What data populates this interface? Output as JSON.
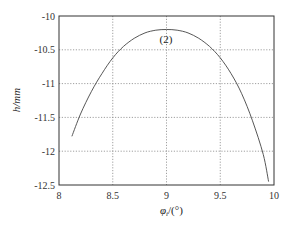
{
  "chart_data": {
    "type": "line",
    "title": "",
    "xlabel": "φ_i/(°)",
    "ylabel": "h/mm",
    "xlim": [
      8,
      10
    ],
    "ylim": [
      -12.5,
      -10
    ],
    "grid": true,
    "x_ticks": [
      "8",
      "8.5",
      "9",
      "9.5",
      "10"
    ],
    "y_ticks": [
      "-10",
      "-10.5",
      "-11",
      "-11.5",
      "-12",
      "-12.5"
    ],
    "annotations": [
      {
        "text": "(2)",
        "x": 9.0,
        "y": -10.33
      }
    ],
    "series": [
      {
        "name": "(2)",
        "x": [
          8.12,
          8.2,
          8.3,
          8.4,
          8.5,
          8.6,
          8.7,
          8.8,
          8.9,
          9.0,
          9.1,
          9.2,
          9.3,
          9.4,
          9.5,
          9.6,
          9.7,
          9.8,
          9.9,
          9.95
        ],
        "values": [
          -11.78,
          -11.45,
          -11.12,
          -10.85,
          -10.62,
          -10.45,
          -10.33,
          -10.25,
          -10.21,
          -10.2,
          -10.21,
          -10.25,
          -10.33,
          -10.45,
          -10.62,
          -10.85,
          -11.15,
          -11.55,
          -12.05,
          -12.45
        ]
      }
    ]
  },
  "labels": {
    "xlabel_main": "φ",
    "xlabel_sub": "i",
    "xlabel_unit": "/(°)",
    "ylabel": "h/mm",
    "annotation": "(2)"
  }
}
